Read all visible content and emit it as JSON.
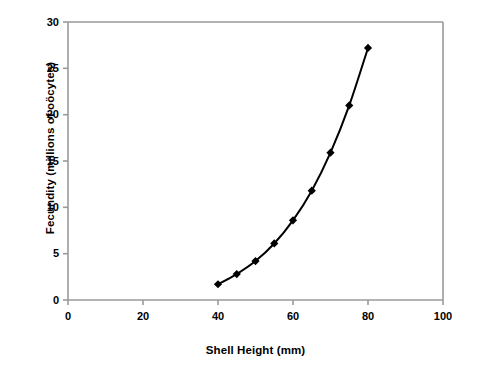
{
  "chart_data": {
    "type": "line",
    "title": "",
    "subtitle": "",
    "xlabel": "Shell Height (mm)",
    "ylabel": "Fecundity (millions of oöcytes)",
    "xlim": [
      0,
      100
    ],
    "ylim": [
      0,
      30
    ],
    "xticks": [
      0,
      20,
      40,
      60,
      80,
      100
    ],
    "yticks": [
      0,
      5,
      10,
      15,
      20,
      25,
      30
    ],
    "xtick_labels": [
      "0",
      "20",
      "40",
      "60",
      "80",
      "100"
    ],
    "ytick_labels": [
      "0",
      "5",
      "10",
      "15",
      "20",
      "25",
      "30"
    ],
    "grid": false,
    "legend": false,
    "legend_position": "none",
    "marker": "diamond",
    "marker_color": "#000000",
    "line_color": "#000000",
    "line_width": 2,
    "axis_color": "#999999",
    "background_color": "#ffffff",
    "x": [
      40,
      45,
      50,
      55,
      60,
      65,
      70,
      75,
      80
    ],
    "y": [
      1.7,
      2.8,
      4.2,
      6.1,
      8.6,
      11.8,
      15.9,
      21.0,
      27.2
    ],
    "series": [
      {
        "name": "Fecundity",
        "x": [
          40,
          45,
          50,
          55,
          60,
          65,
          70,
          75,
          80
        ],
        "values": [
          1.7,
          2.8,
          4.2,
          6.1,
          8.6,
          11.8,
          15.9,
          21.0,
          27.2
        ]
      }
    ],
    "annotations": []
  },
  "axes": {
    "x_title": "Shell Height (mm)",
    "y_title": "Fecundity (millions of oöcytes)"
  }
}
